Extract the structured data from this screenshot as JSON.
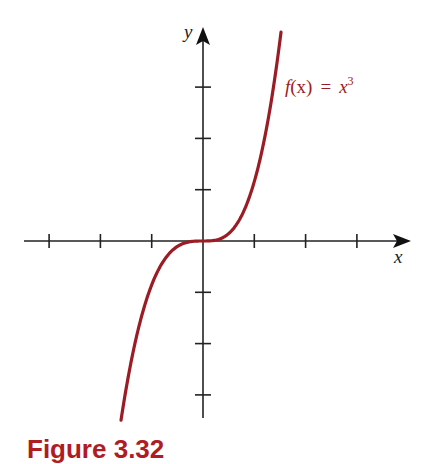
{
  "chart_data": {
    "type": "line",
    "title": "",
    "function_label": "f(x) = x³",
    "xlabel": "x",
    "ylabel": "y",
    "x_ticks": [
      -3,
      -2,
      -1,
      1,
      2,
      3
    ],
    "y_ticks": [
      -3,
      -2,
      -1,
      1,
      2,
      3
    ],
    "tick_labels_shown": false,
    "xlim": [
      -3.5,
      4.0
    ],
    "ylim": [
      -3.4,
      4.1
    ],
    "grid": false,
    "series": [
      {
        "name": "f(x) = x^3",
        "color": "#9b1c24",
        "x": [
          -1.59,
          -1.2,
          -1.0,
          -0.6,
          -0.3,
          0,
          0.3,
          0.6,
          1.0,
          1.2,
          1.51
        ],
        "y": [
          -3.44,
          -1.55,
          -0.99,
          -0.21,
          -0.03,
          0,
          0.04,
          0.28,
          1.19,
          2.05,
          4.04
        ]
      }
    ]
  },
  "labels": {
    "x_axis": "x",
    "y_axis": "y",
    "function": {
      "f": "f",
      "paren": "(x)",
      "eq": "=",
      "base": "x",
      "exp": "3"
    },
    "caption": "Figure 3.32"
  },
  "colors": {
    "curve": "#9b1c24",
    "axis": "#222222",
    "caption": "#b01c24"
  }
}
